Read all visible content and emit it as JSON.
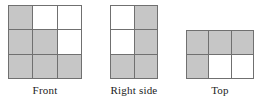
{
  "colors": {
    "shaded": "#c6c6c6",
    "empty": "#ffffff",
    "line": "#707070",
    "text": "#1b1b1b"
  },
  "views": [
    {
      "id": "front",
      "label": "Front",
      "rows": 3,
      "cols": 3,
      "cells": [
        [
          "shaded",
          "empty",
          "empty"
        ],
        [
          "shaded",
          "shaded",
          "empty"
        ],
        [
          "shaded",
          "shaded",
          "shaded"
        ]
      ]
    },
    {
      "id": "right-side",
      "label": "Right side",
      "rows": 3,
      "cols": 2,
      "cells": [
        [
          "empty",
          "shaded"
        ],
        [
          "empty",
          "shaded"
        ],
        [
          "shaded",
          "shaded"
        ]
      ]
    },
    {
      "id": "top",
      "label": "Top",
      "rows": 2,
      "cols": 3,
      "cells": [
        [
          "shaded",
          "shaded",
          "shaded"
        ],
        [
          "shaded",
          "empty",
          "empty"
        ]
      ]
    }
  ]
}
